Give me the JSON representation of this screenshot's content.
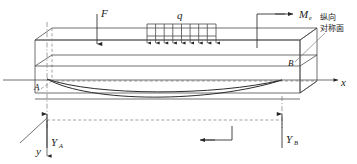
{
  "figure": {
    "title": "",
    "type": "engineering-beam-diagram"
  },
  "labels": {
    "force_F": "F",
    "distributed_q": "q",
    "moment_M": "M",
    "moment_M_sub": "e",
    "support_A": "A",
    "support_B": "B",
    "reaction_A": "Y",
    "reaction_A_sub": "A",
    "reaction_B": "Y",
    "reaction_B_sub": "B",
    "axis_x": "x",
    "axis_y": "y",
    "annotation_line1": "纵向",
    "annotation_line2": "对称面"
  },
  "loads": {
    "concentrated_force": {
      "name": "F",
      "direction": "down",
      "x": 97
    },
    "distributed_load": {
      "name": "q",
      "direction": "down",
      "arrow_count": 9,
      "x_start": 147,
      "x_end": 216,
      "label_x": 181
    },
    "end_moment": {
      "name": "Me",
      "direction": "right",
      "x": 257
    }
  },
  "reactions": [
    {
      "name": "YA",
      "direction": "up",
      "x": 47
    },
    {
      "name": "YB",
      "direction": "up",
      "x": 282
    }
  ],
  "axes": {
    "x_label": "x",
    "x_direction": "right",
    "y_label": "y",
    "y_direction": "down",
    "origin_x": 47,
    "origin_y": 80
  },
  "colors": {
    "line": "#4d4d4d",
    "line_dark": "#333333",
    "dashed": "#8c8c8c",
    "curve": "#2b2b2b",
    "text": "#1a1a1a",
    "background": "#ffffff"
  }
}
